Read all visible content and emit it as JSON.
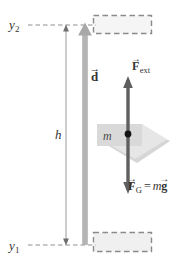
{
  "figure": {
    "colors": {
      "ink": "#343434",
      "dashed_border": "#8c8c8c",
      "box_fill": "#f0f0f0",
      "d_arrow": "#9a9a9a",
      "force_arrow": "#5e5e5e",
      "slab_fill": "#d8d8d8",
      "dot": "#111111",
      "dimension_line": "#9b9b9b"
    },
    "labels": {
      "y_top": "y",
      "y_top_sub": "2",
      "y_bottom": "y",
      "y_bottom_sub": "1",
      "height": "h",
      "displacement": "d",
      "displacement_accent": "→",
      "mass": "m",
      "force_ext_symbol": "F",
      "force_ext_sub": "ext",
      "force_ext_accent": "→",
      "force_grav_symbol": "F",
      "force_grav_sub": "G",
      "force_grav_accent": "→",
      "equals": "=",
      "mass_factor": "m",
      "gravity_symbol": "g",
      "gravity_accent": "→"
    },
    "elements": {
      "top_box_name": "final-position-box",
      "bottom_box_name": "initial-position-box",
      "displacement_arrow_name": "displacement-arrow",
      "dimension_name": "height-dimension-line",
      "force_arrow_name": "force-double-arrow",
      "slab_name": "mass-slab",
      "dot_name": "center-of-mass-dot"
    }
  }
}
